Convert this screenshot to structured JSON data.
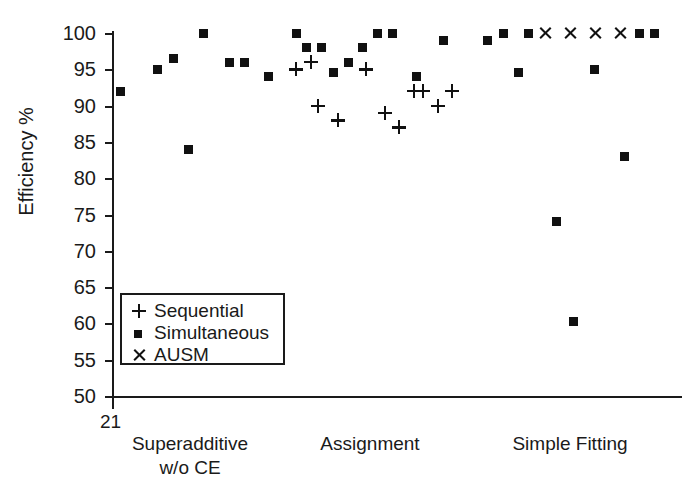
{
  "chart_data": {
    "type": "scatter",
    "title": "",
    "xlabel": "",
    "ylabel": "Efficiency %",
    "ylim": [
      50,
      100
    ],
    "yticks": [
      50,
      55,
      60,
      65,
      70,
      75,
      80,
      85,
      90,
      95,
      100
    ],
    "grid": false,
    "axis_origin_label": "21",
    "legend_position": "lower left inside axes",
    "categories": [
      "Superadditive w/o CE",
      "Assignment",
      "Simple Fitting"
    ],
    "category_labels": [
      {
        "line1": "Superadditive",
        "line2": "w/o CE"
      },
      {
        "line1": "Assignment",
        "line2": ""
      },
      {
        "line1": "Simple Fitting",
        "line2": ""
      }
    ],
    "series": [
      {
        "name": "Sequential",
        "marker": "plus",
        "color": "#111111",
        "points": [
          {
            "group": "Assignment",
            "x": 296,
            "y": 95
          },
          {
            "group": "Assignment",
            "x": 311,
            "y": 96
          },
          {
            "group": "Assignment",
            "x": 318,
            "y": 90
          },
          {
            "group": "Assignment",
            "x": 338,
            "y": 88
          },
          {
            "group": "Assignment",
            "x": 366,
            "y": 95
          },
          {
            "group": "Assignment",
            "x": 385,
            "y": 89
          },
          {
            "group": "Assignment",
            "x": 399,
            "y": 87
          },
          {
            "group": "Assignment",
            "x": 414,
            "y": 92
          },
          {
            "group": "Assignment",
            "x": 423,
            "y": 92
          },
          {
            "group": "Assignment",
            "x": 438,
            "y": 90
          },
          {
            "group": "Assignment",
            "x": 452,
            "y": 92
          }
        ]
      },
      {
        "name": "Simultaneous",
        "marker": "square",
        "color": "#111111",
        "points": [
          {
            "group": "Superadditive w/o CE",
            "x": 120,
            "y": 92
          },
          {
            "group": "Superadditive w/o CE",
            "x": 157,
            "y": 95
          },
          {
            "group": "Superadditive w/o CE",
            "x": 173,
            "y": 96.5
          },
          {
            "group": "Superadditive w/o CE",
            "x": 188,
            "y": 84
          },
          {
            "group": "Superadditive w/o CE",
            "x": 203,
            "y": 100
          },
          {
            "group": "Superadditive w/o CE",
            "x": 229,
            "y": 96
          },
          {
            "group": "Superadditive w/o CE",
            "x": 244,
            "y": 96
          },
          {
            "group": "Assignment",
            "x": 268,
            "y": 94
          },
          {
            "group": "Assignment",
            "x": 296,
            "y": 100
          },
          {
            "group": "Assignment",
            "x": 306,
            "y": 98
          },
          {
            "group": "Assignment",
            "x": 321,
            "y": 98
          },
          {
            "group": "Assignment",
            "x": 333,
            "y": 94.5
          },
          {
            "group": "Assignment",
            "x": 348,
            "y": 96
          },
          {
            "group": "Assignment",
            "x": 362,
            "y": 98
          },
          {
            "group": "Assignment",
            "x": 377,
            "y": 100
          },
          {
            "group": "Assignment",
            "x": 392,
            "y": 100
          },
          {
            "group": "Assignment",
            "x": 416,
            "y": 94
          },
          {
            "group": "Assignment",
            "x": 443,
            "y": 99
          },
          {
            "group": "Simple Fitting",
            "x": 487,
            "y": 99
          },
          {
            "group": "Simple Fitting",
            "x": 503,
            "y": 100
          },
          {
            "group": "Simple Fitting",
            "x": 518,
            "y": 94.5
          },
          {
            "group": "Simple Fitting",
            "x": 528,
            "y": 100
          },
          {
            "group": "Simple Fitting",
            "x": 594,
            "y": 95
          },
          {
            "group": "Simple Fitting",
            "x": 624,
            "y": 83
          },
          {
            "group": "Simple Fitting",
            "x": 556,
            "y": 74
          },
          {
            "group": "Simple Fitting",
            "x": 573,
            "y": 60.3
          },
          {
            "group": "Simple Fitting",
            "x": 639,
            "y": 100
          },
          {
            "group": "Simple Fitting",
            "x": 654,
            "y": 100
          }
        ]
      },
      {
        "name": "AUSM",
        "marker": "cross",
        "color": "#111111",
        "points": [
          {
            "group": "Simple Fitting",
            "x": 545,
            "y": 100
          },
          {
            "group": "Simple Fitting",
            "x": 570,
            "y": 100
          },
          {
            "group": "Simple Fitting",
            "x": 595,
            "y": 100
          },
          {
            "group": "Simple Fitting",
            "x": 620,
            "y": 100
          }
        ]
      }
    ]
  },
  "legend": {
    "items": [
      {
        "symbol": "plus",
        "label": "Sequential"
      },
      {
        "symbol": "square",
        "label": "Simultaneous"
      },
      {
        "symbol": "cross",
        "label": "AUSM"
      }
    ]
  },
  "axes": {
    "y_label": "Efficiency %",
    "origin_label": "21"
  }
}
